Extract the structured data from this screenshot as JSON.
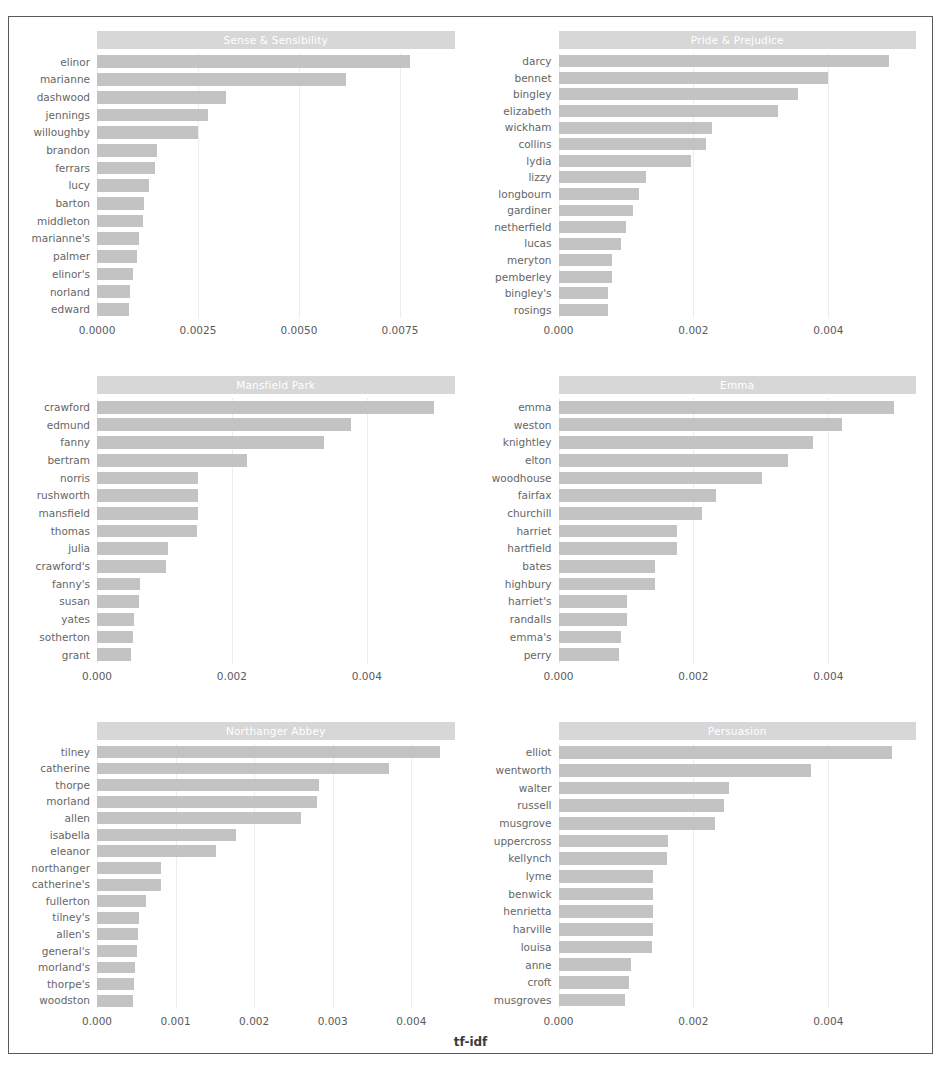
{
  "figure": {
    "xlabel": "tf-idf",
    "strip_bg": "#d7d7d7",
    "bar_color": "#c3c3c3",
    "frame_color": "#5a5a5a"
  },
  "chart_data": {
    "type": "bar",
    "title": "",
    "xlabel": "tf-idf",
    "ylabel": "",
    "orientation": "horizontal",
    "grid": false,
    "legend": "none",
    "facets": [
      {
        "name": "Sense & Sensibility",
        "xlim": [
          0,
          0.00885
        ],
        "xticks": [
          0,
          0.0025,
          0.005,
          0.0075
        ],
        "xticklabels": [
          "0.0000",
          "0.0025",
          "0.0050",
          "0.0075"
        ],
        "categories": [
          "elinor",
          "marianne",
          "dashwood",
          "jennings",
          "willoughby",
          "brandon",
          "ferrars",
          "lucy",
          "barton",
          "middleton",
          "marianne's",
          "palmer",
          "elinor's",
          "norland",
          "edward"
        ],
        "values": [
          0.00775,
          0.00617,
          0.0032,
          0.00275,
          0.0025,
          0.00148,
          0.00143,
          0.00128,
          0.00116,
          0.00114,
          0.00104,
          0.001,
          0.0009,
          0.00082,
          0.0008
        ]
      },
      {
        "name": "Pride & Prejudice",
        "xlim": [
          0,
          0.0053
        ],
        "xticks": [
          0,
          0.002,
          0.004
        ],
        "xticklabels": [
          "0.000",
          "0.002",
          "0.004"
        ],
        "categories": [
          "darcy",
          "bennet",
          "bingley",
          "elizabeth",
          "wickham",
          "collins",
          "lydia",
          "lizzy",
          "longbourn",
          "gardiner",
          "netherfield",
          "lucas",
          "meryton",
          "pemberley",
          "bingley's",
          "rosings"
        ],
        "values": [
          0.0049,
          0.004,
          0.00355,
          0.00325,
          0.00228,
          0.00218,
          0.00196,
          0.00129,
          0.0012,
          0.0011,
          0.001,
          0.00093,
          0.0008,
          0.00079,
          0.00074,
          0.00073
        ]
      },
      {
        "name": "Mansfield Park",
        "xlim": [
          0,
          0.0053
        ],
        "xticks": [
          0,
          0.002,
          0.004
        ],
        "xticklabels": [
          "0.000",
          "0.002",
          "0.004"
        ],
        "categories": [
          "crawford",
          "edmund",
          "fanny",
          "bertram",
          "norris",
          "rushworth",
          "mansfield",
          "thomas",
          "julia",
          "crawford's",
          "fanny's",
          "susan",
          "yates",
          "sotherton",
          "grant"
        ],
        "values": [
          0.005,
          0.00377,
          0.00337,
          0.00222,
          0.0015,
          0.0015,
          0.0015,
          0.00148,
          0.00105,
          0.00103,
          0.00064,
          0.00062,
          0.00055,
          0.00053,
          0.0005
        ]
      },
      {
        "name": "Emma",
        "xlim": [
          0,
          0.0053
        ],
        "xticks": [
          0,
          0.002,
          0.004
        ],
        "xticklabels": [
          "0.000",
          "0.002",
          "0.004"
        ],
        "categories": [
          "emma",
          "weston",
          "knightley",
          "elton",
          "woodhouse",
          "fairfax",
          "churchill",
          "harriet",
          "hartfield",
          "bates",
          "highbury",
          "harriet's",
          "randalls",
          "emma's",
          "perry"
        ],
        "values": [
          0.00497,
          0.0042,
          0.00378,
          0.0034,
          0.00302,
          0.00233,
          0.00212,
          0.00175,
          0.00175,
          0.00143,
          0.00143,
          0.00102,
          0.00102,
          0.00093,
          0.0009
        ]
      },
      {
        "name": "Northanger Abbey",
        "xlim": [
          0,
          0.00455
        ],
        "xticks": [
          0,
          0.001,
          0.002,
          0.003,
          0.004
        ],
        "xticklabels": [
          "0.000",
          "0.001",
          "0.002",
          "0.003",
          "0.004"
        ],
        "categories": [
          "tilney",
          "catherine",
          "thorpe",
          "morland",
          "allen",
          "isabella",
          "eleanor",
          "northanger",
          "catherine's",
          "fullerton",
          "tilney's",
          "allen's",
          "general's",
          "morland's",
          "thorpe's",
          "woodston"
        ],
        "values": [
          0.00437,
          0.00372,
          0.00283,
          0.0028,
          0.0026,
          0.00177,
          0.00152,
          0.00081,
          0.00081,
          0.00062,
          0.00053,
          0.00052,
          0.00051,
          0.00048,
          0.00047,
          0.00046
        ]
      },
      {
        "name": "Persuasion",
        "xlim": [
          0,
          0.0053
        ],
        "xticks": [
          0,
          0.002,
          0.004
        ],
        "xticklabels": [
          "0.000",
          "0.002",
          "0.004"
        ],
        "categories": [
          "elliot",
          "wentworth",
          "walter",
          "russell",
          "musgrove",
          "uppercross",
          "kellynch",
          "lyme",
          "benwick",
          "henrietta",
          "harville",
          "louisa",
          "anne",
          "croft",
          "musgroves"
        ],
        "values": [
          0.00494,
          0.00375,
          0.00253,
          0.00246,
          0.00232,
          0.00163,
          0.00161,
          0.0014,
          0.0014,
          0.0014,
          0.0014,
          0.00138,
          0.00107,
          0.00105,
          0.00099
        ]
      }
    ]
  }
}
